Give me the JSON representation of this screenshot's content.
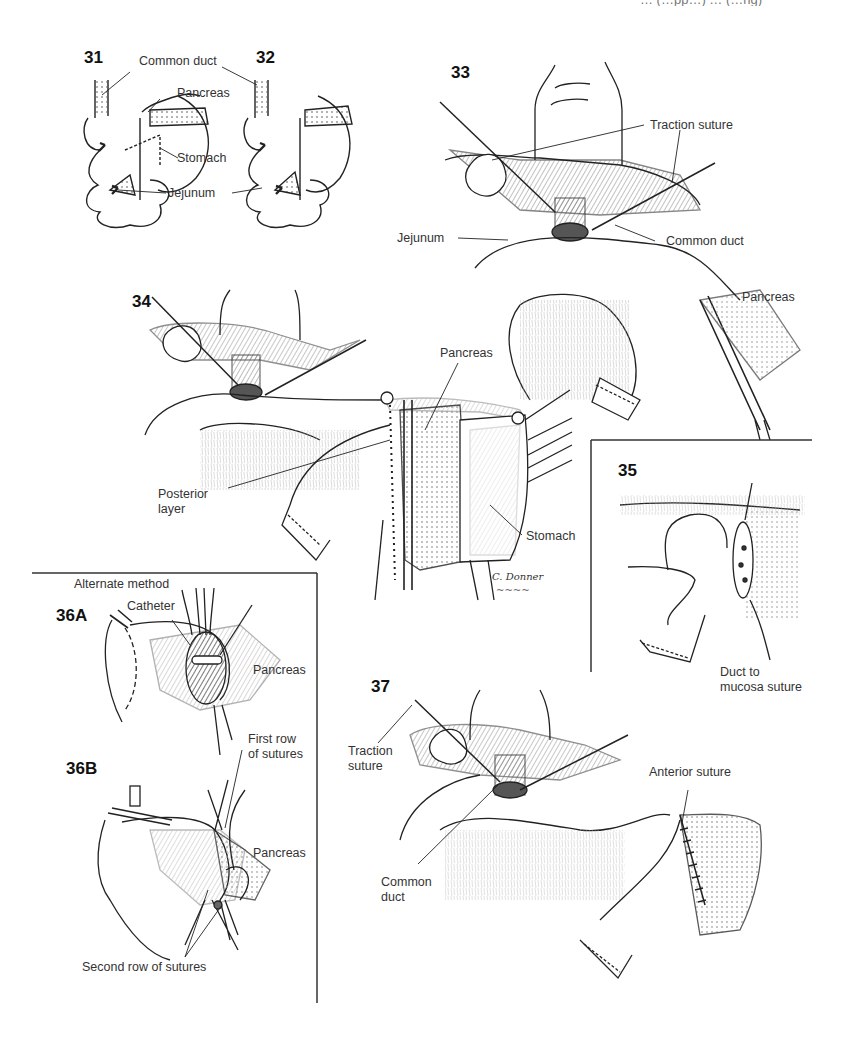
{
  "running_header": "… (…pp…) … (…ng)",
  "figures": {
    "f31": {
      "number": "31"
    },
    "f32": {
      "number": "32"
    },
    "f33": {
      "number": "33"
    },
    "f34": {
      "number": "34"
    },
    "f35": {
      "number": "35"
    },
    "f36a": {
      "number": "36A"
    },
    "f36b": {
      "number": "36B"
    },
    "f37": {
      "number": "37"
    }
  },
  "labels": {
    "f31_32": {
      "common_duct": "Common duct",
      "pancreas": "Pancreas",
      "stomach": "Stomach",
      "jejunum": "Jejunum"
    },
    "f33": {
      "traction_suture": "Traction suture",
      "jejunum": "Jejunum",
      "common_duct": "Common duct",
      "pancreas": "Pancreas"
    },
    "f34": {
      "pancreas": "Pancreas",
      "posterior_layer_1": "Posterior",
      "posterior_layer_2": "layer",
      "stomach": "Stomach"
    },
    "f35": {
      "duct_to_mucosa_1": "Duct to",
      "duct_to_mucosa_2": "mucosa suture"
    },
    "f36": {
      "alternate_method": "Alternate method",
      "catheter": "Catheter",
      "pancreas_a": "Pancreas",
      "first_row_1": "First row",
      "first_row_2": "of sutures",
      "pancreas_b": "Pancreas",
      "second_row": "Second row of sutures"
    },
    "f37": {
      "traction_suture_1": "Traction",
      "traction_suture_2": "suture",
      "anterior_suture": "Anterior suture",
      "common_duct_1": "Common",
      "common_duct_2": "duct"
    }
  },
  "signature": {
    "artist": "C. Donner",
    "scribble": "~~~~"
  }
}
